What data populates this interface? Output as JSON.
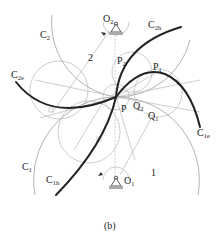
{
  "figure": {
    "caption": "(b)",
    "labels": {
      "O2": {
        "main": "O",
        "sub": "2"
      },
      "O1": {
        "main": "O",
        "sub": "1"
      },
      "C2": {
        "main": "C",
        "sub": "2"
      },
      "C2e": {
        "main": "C",
        "sub": "2e"
      },
      "C2h": {
        "main": "C",
        "sub": "2h"
      },
      "C1": {
        "main": "C",
        "sub": "1"
      },
      "C1e": {
        "main": "C",
        "sub": "1e"
      },
      "C1h": {
        "main": "C",
        "sub": "1h"
      },
      "P": {
        "main": "P",
        "sub": ""
      },
      "P1": {
        "main": "P",
        "sub": "1"
      },
      "P2": {
        "main": "P",
        "sub": "2"
      },
      "Q1": {
        "main": "Q",
        "sub": "1"
      },
      "Q2": {
        "main": "Q",
        "sub": "2"
      },
      "link2": {
        "main": "2",
        "sub": ""
      },
      "link1": {
        "main": "1",
        "sub": ""
      }
    },
    "colors": {
      "thick_curve": "#222222",
      "construction": "#b8b8b8",
      "background": "#ffffff"
    }
  }
}
